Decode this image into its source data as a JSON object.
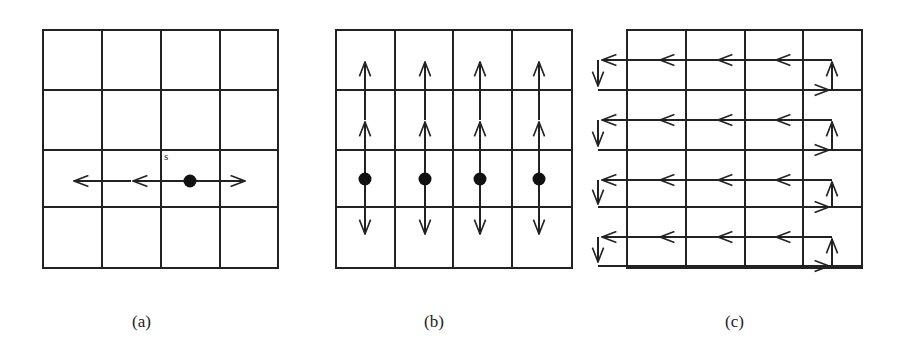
{
  "panels": [
    {
      "id": "a",
      "caption": "(a)",
      "start_label": "s"
    },
    {
      "id": "b",
      "caption": "(b)"
    },
    {
      "id": "c",
      "caption": "(c)"
    }
  ],
  "grid": {
    "rows": 4,
    "cols": 4,
    "line_color": "#222222"
  }
}
